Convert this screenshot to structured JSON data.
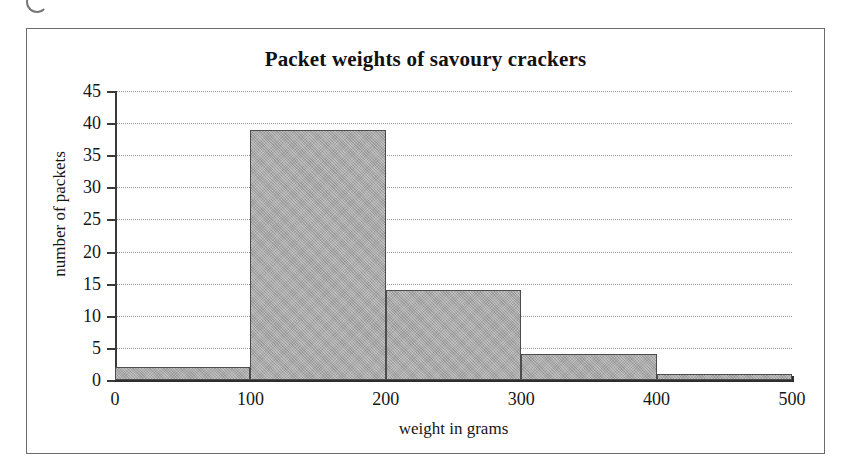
{
  "figure": {
    "title": "Packet weights of savoury crackers"
  },
  "chart_data": {
    "type": "bar",
    "title": "Packet weights of savoury crackers",
    "xlabel": "weight in grams",
    "ylabel": "number of packets",
    "categories": [
      "0-100",
      "100-200",
      "200-300",
      "300-400",
      "400-500"
    ],
    "bin_edges": [
      0,
      100,
      200,
      300,
      400,
      500
    ],
    "values": [
      2,
      39,
      14,
      4,
      1
    ],
    "xlim": [
      0,
      500
    ],
    "ylim": [
      0,
      45
    ],
    "xticks": [
      0,
      100,
      200,
      300,
      400,
      500
    ],
    "yticks": [
      0,
      5,
      10,
      15,
      20,
      25,
      30,
      35,
      40,
      45
    ],
    "xtick_labels": [
      "0",
      "100",
      "200",
      "300",
      "400",
      "500"
    ],
    "ytick_labels": [
      "0",
      "5",
      "10",
      "15",
      "20",
      "25",
      "30",
      "35",
      "40",
      "45"
    ],
    "grid": "horizontal-dotted",
    "legend": "none",
    "bar_fill_color": "#a8a8a8",
    "bar_edge_color": "#4d4d4d",
    "gridline_color": "#9a9a9a",
    "axis_color": "#2e2e2e",
    "background_color": "#ffffff"
  }
}
